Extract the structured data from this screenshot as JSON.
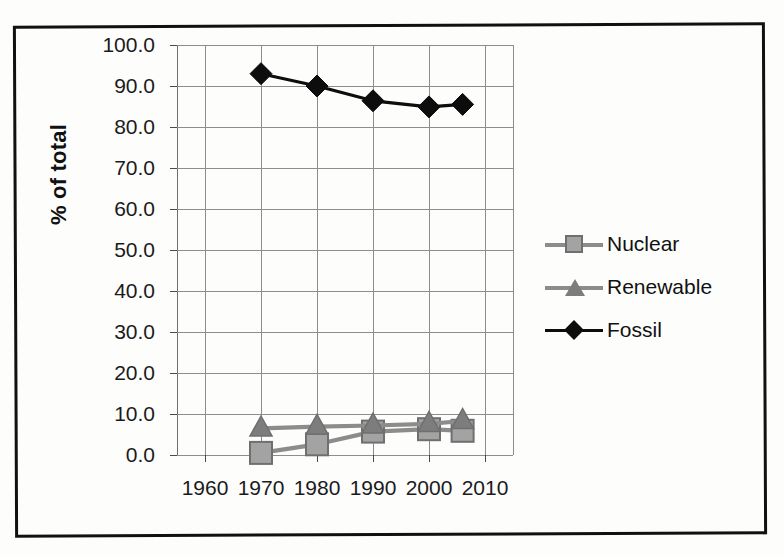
{
  "figure": {
    "background_color": "#fdfdfc",
    "frame_color": "#111111"
  },
  "chart_data": {
    "type": "line",
    "title": "",
    "subtitle": "",
    "xlabel": "",
    "ylabel": "% of total",
    "xlim": [
      1955,
      2015
    ],
    "ylim": [
      0.0,
      100.0
    ],
    "ytick_step": 10.0,
    "grid": true,
    "legend_position": "right",
    "x": [
      1970,
      1980,
      1990,
      2000,
      2006
    ],
    "xticks": [
      "1960",
      "1970",
      "1980",
      "1990",
      "2000",
      "2010"
    ],
    "xtick_values": [
      1960,
      1970,
      1980,
      1990,
      2000,
      2010
    ],
    "yticks": [
      "0.0",
      "10.0",
      "20.0",
      "30.0",
      "40.0",
      "50.0",
      "60.0",
      "70.0",
      "80.0",
      "90.0",
      "100.0"
    ],
    "ytick_values": [
      0.0,
      10.0,
      20.0,
      30.0,
      40.0,
      50.0,
      60.0,
      70.0,
      80.0,
      90.0,
      100.0
    ],
    "series": [
      {
        "name": "Nuclear",
        "marker": "square",
        "color": "#a3a3a3",
        "line_color": "#8c8c8c",
        "marker_edge_color": "#6f6f6f",
        "values": [
          0.5,
          2.6,
          5.7,
          6.3,
          5.9
        ]
      },
      {
        "name": "Renewable",
        "marker": "triangle",
        "color": "#7d7d7d",
        "line_color": "#8c8c8c",
        "marker_edge_color": "#6f6f6f",
        "values": [
          6.5,
          6.9,
          7.2,
          7.6,
          8.3
        ]
      },
      {
        "name": "Fossil",
        "marker": "diamond",
        "color": "#0d0d0d",
        "line_color": "#0d0d0d",
        "marker_edge_color": "#0d0d0d",
        "values": [
          93.0,
          90.0,
          86.4,
          84.9,
          85.5
        ]
      }
    ]
  },
  "legend": {
    "items": [
      {
        "label": "Nuclear"
      },
      {
        "label": "Renewable"
      },
      {
        "label": "Fossil"
      }
    ]
  }
}
